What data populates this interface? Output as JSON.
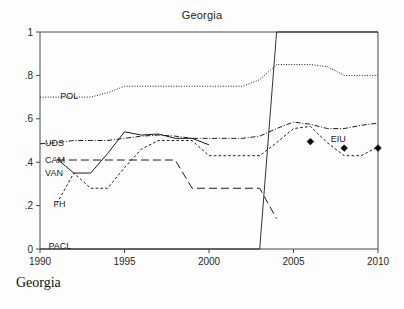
{
  "figure": {
    "title": "Georgia",
    "caption": "Georgia"
  },
  "chart_data": {
    "type": "line",
    "title": "Georgia",
    "xlabel": "",
    "ylabel": "",
    "xlim": [
      1990,
      2010
    ],
    "ylim": [
      0,
      1
    ],
    "xticks": [
      1990,
      1995,
      2000,
      2005,
      2010
    ],
    "xtick_labels": [
      "1990",
      "1995",
      "2000",
      "2005",
      "2010"
    ],
    "yticks": [
      0,
      0.2,
      0.4,
      0.6,
      0.8,
      1
    ],
    "ytick_labels": [
      "0",
      ".2",
      ".4",
      ".6",
      ".8",
      "1"
    ],
    "grid": false,
    "legend_position": "inline-series-labels",
    "series": [
      {
        "name": "POL",
        "label": "POL",
        "style": "dotted",
        "label_x": 1991.2,
        "label_y": 0.705,
        "x": [
          1990,
          1991,
          1992,
          1993,
          1994,
          1995,
          1996,
          1997,
          1998,
          1999,
          2000,
          2001,
          2002,
          2003,
          2004,
          2005,
          2006,
          2007,
          2008,
          2009,
          2010
        ],
        "y": [
          0.7,
          0.7,
          0.7,
          0.7,
          0.72,
          0.75,
          0.75,
          0.75,
          0.75,
          0.75,
          0.75,
          0.75,
          0.75,
          0.78,
          0.85,
          0.85,
          0.85,
          0.84,
          0.8,
          0.8,
          0.8
        ]
      },
      {
        "name": "UDS",
        "label": "UDS",
        "style": "dashdot",
        "label_x": 1990.3,
        "label_y": 0.487,
        "x": [
          1990,
          1991,
          1992,
          1993,
          1994,
          1995,
          1996,
          1997,
          1998,
          1999,
          2000,
          2001,
          2002,
          2003,
          2004,
          2005,
          2006,
          2007,
          2008,
          2009,
          2010
        ],
        "y": [
          0.485,
          0.49,
          0.5,
          0.5,
          0.5,
          0.51,
          0.52,
          0.525,
          0.52,
          0.51,
          0.51,
          0.51,
          0.51,
          0.52,
          0.555,
          0.585,
          0.575,
          0.555,
          0.555,
          0.57,
          0.58
        ]
      },
      {
        "name": "CAM",
        "label": "CAM",
        "style": "longdash",
        "label_x": 1990.3,
        "label_y": 0.408,
        "x": [
          1991,
          1992,
          1993,
          1994,
          1995,
          1996,
          1997,
          1998,
          1999,
          2000,
          2001,
          2002,
          2003,
          2004
        ],
        "y": [
          0.41,
          0.41,
          0.41,
          0.41,
          0.41,
          0.41,
          0.41,
          0.41,
          0.28,
          0.28,
          0.28,
          0.28,
          0.28,
          0.14
        ]
      },
      {
        "name": "VAN",
        "label": "VAN",
        "style": "solid",
        "label_x": 1990.3,
        "label_y": 0.352,
        "x": [
          1991,
          1992,
          1993,
          1994,
          1995,
          1996,
          1997,
          1998,
          1999,
          2000
        ],
        "y": [
          0.415,
          0.35,
          0.35,
          0.44,
          0.54,
          0.525,
          0.53,
          0.51,
          0.51,
          0.48
        ]
      },
      {
        "name": "FH",
        "label": "FH",
        "style": "shortdash",
        "label_x": 1990.8,
        "label_y": 0.208,
        "x": [
          1991,
          1992,
          1993,
          1994,
          1995,
          1996,
          1997,
          1998,
          1999,
          2000,
          2001,
          2002,
          2003,
          2004,
          2005,
          2006,
          2007,
          2008,
          2009,
          2010
        ],
        "y": [
          0.21,
          0.35,
          0.28,
          0.28,
          0.375,
          0.46,
          0.5,
          0.5,
          0.5,
          0.43,
          0.43,
          0.43,
          0.43,
          0.49,
          0.555,
          0.565,
          0.49,
          0.43,
          0.43,
          0.47
        ]
      },
      {
        "name": "PACL",
        "label": "PACL",
        "style": "solid",
        "label_x": 1990.5,
        "label_y": 0.012,
        "x": [
          1990,
          2003,
          2003,
          2004,
          2010
        ],
        "y": [
          0,
          0,
          0,
          1,
          1
        ]
      },
      {
        "name": "EIU",
        "label": "EIU",
        "style": "markers",
        "label_x": 2007.2,
        "label_y": 0.505,
        "x": [
          2006,
          2008,
          2010
        ],
        "y": [
          0.495,
          0.465,
          0.465
        ]
      }
    ]
  }
}
